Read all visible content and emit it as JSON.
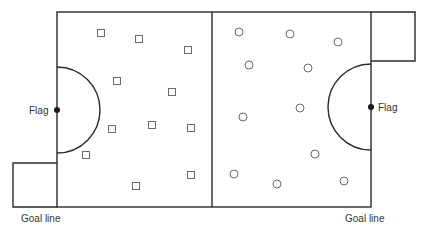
{
  "diagram": {
    "type": "field-layout",
    "colors": {
      "line": "#2a2a2a",
      "marker": "#6a6a6a",
      "background": "#ffffff"
    },
    "field": {
      "left": 57,
      "top": 12,
      "right": 371,
      "bottom": 207,
      "center_x": 212
    },
    "goal_boxes": [
      {
        "side": "left",
        "x": 13,
        "y": 163,
        "width": 44,
        "height": 44
      },
      {
        "side": "right",
        "x": 371,
        "y": 12,
        "width": 44,
        "height": 49
      }
    ],
    "arcs": [
      {
        "side": "left",
        "cx": 57,
        "cy": 110,
        "r": 43
      },
      {
        "side": "right",
        "cx": 371,
        "cy": 107,
        "r": 43
      }
    ],
    "flags": [
      {
        "side": "left",
        "x": 57,
        "y": 110,
        "label": "Flag"
      },
      {
        "side": "right",
        "x": 371,
        "y": 107,
        "label": "Flag"
      }
    ],
    "labels": {
      "left_goal_line": "Goal line",
      "right_goal_line": "Goal line",
      "left_flag": "Flag",
      "right_flag": "Flag"
    },
    "team_squares": [
      [
        101,
        33
      ],
      [
        139,
        39
      ],
      [
        188,
        50
      ],
      [
        117,
        81
      ],
      [
        172,
        92
      ],
      [
        112,
        129
      ],
      [
        152,
        125
      ],
      [
        191,
        128
      ],
      [
        86,
        155
      ],
      [
        136,
        186
      ],
      [
        191,
        175
      ]
    ],
    "team_circles": [
      [
        239,
        32
      ],
      [
        290,
        34
      ],
      [
        338,
        42
      ],
      [
        249,
        65
      ],
      [
        308,
        68
      ],
      [
        300,
        108
      ],
      [
        243,
        117
      ],
      [
        315,
        154
      ],
      [
        234,
        174
      ],
      [
        277,
        184
      ],
      [
        344,
        181
      ]
    ]
  }
}
